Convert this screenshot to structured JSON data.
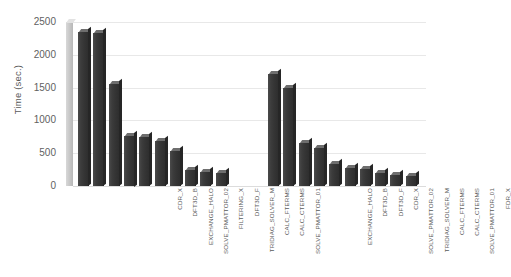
{
  "chart_data": {
    "type": "bar",
    "title": "",
    "xlabel": "",
    "ylabel": "Time (sec.)",
    "ylim": [
      0,
      2500
    ],
    "ytick_values": [
      2500,
      2000,
      1500,
      1000,
      500,
      0
    ],
    "ytick_labels": [
      "2500",
      "2000",
      "1500",
      "1000",
      "500",
      "0"
    ],
    "grid": true,
    "legend": "none",
    "style": "3d-bars-grayscale",
    "groups": [
      {
        "name": "group-1",
        "categories": [
          "CDR_X",
          "DFT3D_B",
          "EXCHANGE_HALO",
          "SOLVE_PMATTOR_02",
          "FILTERING_X",
          "DFT3D_F",
          "TRIDIAG_SOLVER_M",
          "CALC_FTERMS",
          "CALC_CTERMS",
          "SOLVE_PMATTOR_01"
        ],
        "values": [
          2350,
          2330,
          1560,
          770,
          740,
          690,
          530,
          240,
          215,
          195
        ]
      },
      {
        "name": "group-2",
        "categories": [
          "EXCHANGE_HALO",
          "DFT3D_B",
          "DFT3D_F",
          "CDR_X",
          "SOLVE_PMATTOR_02",
          "TRIDIAG_SOLVER_M",
          "CALC_FTERMS",
          "CALC_CTERMS",
          "SOLVE_PMATTOR_01",
          "FDR_X"
        ],
        "values": [
          1710,
          1500,
          660,
          580,
          330,
          280,
          255,
          200,
          165,
          150
        ]
      }
    ],
    "colors": {
      "bar": "#3a3a3a",
      "bar_top": "#6e6e6e",
      "gridline": "#e8e8e8",
      "axis_wall": "#c9c9c9",
      "text": "#5a5a5a",
      "background": "#ffffff"
    }
  }
}
